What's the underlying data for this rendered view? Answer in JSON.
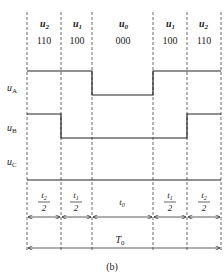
{
  "figure": {
    "caption": "(b)",
    "header": {
      "vectors": [
        {
          "name": "u",
          "sub": "2",
          "code": "110"
        },
        {
          "name": "u",
          "sub": "1",
          "code": "100"
        },
        {
          "name": "u",
          "sub": "0",
          "code": "000"
        },
        {
          "name": "u",
          "sub": "1",
          "code": "100"
        },
        {
          "name": "u",
          "sub": "2",
          "code": "110"
        }
      ]
    },
    "signals": [
      {
        "name": "u",
        "sub": "A",
        "states": [
          1,
          1,
          0,
          1,
          1
        ]
      },
      {
        "name": "u",
        "sub": "B",
        "states": [
          1,
          0,
          0,
          0,
          1
        ]
      },
      {
        "name": "u",
        "sub": "C",
        "states": [
          0,
          0,
          0,
          0,
          0
        ]
      }
    ],
    "durations": [
      {
        "num": "t",
        "num_sub": "2",
        "den": "2"
      },
      {
        "num": "t",
        "num_sub": "1",
        "den": "2"
      },
      {
        "label": "t",
        "label_sub": "0"
      },
      {
        "num": "t",
        "num_sub": "1",
        "den": "2"
      },
      {
        "num": "t",
        "num_sub": "2",
        "den": "2"
      }
    ],
    "period": {
      "name": "T",
      "sub": "0"
    }
  }
}
